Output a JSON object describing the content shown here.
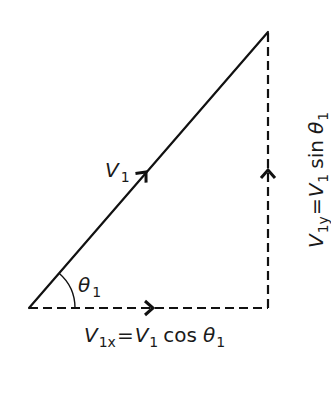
{
  "diagram": {
    "colors": {
      "line": "#111111",
      "text": "#1a1a1a",
      "background": "#ffffff"
    },
    "geometry": {
      "origin": [
        29,
        308
      ],
      "tip": [
        268,
        32
      ],
      "corner": [
        268,
        308
      ],
      "arc_radius": 46
    },
    "vector": {
      "symbol": "V",
      "subscript": "1",
      "style": "solid",
      "arrow_direction": "up-right"
    },
    "angle": {
      "symbol": "θ",
      "subscript": "1"
    },
    "x_component": {
      "style": "dashed",
      "arrow_direction": "right",
      "label": {
        "lhs_symbol": "V",
        "lhs_subscript": "1x",
        "equals": "=",
        "rhs_symbol": "V",
        "rhs_subscript": "1",
        "func": "cos",
        "angle_symbol": "θ",
        "angle_subscript": "1"
      }
    },
    "y_component": {
      "style": "dashed",
      "arrow_direction": "up",
      "label": {
        "lhs_symbol": "V",
        "lhs_subscript": "1y",
        "equals": "=",
        "rhs_symbol": "V",
        "rhs_subscript": "1",
        "func": "sin",
        "angle_symbol": "θ",
        "angle_subscript": "1"
      }
    }
  }
}
